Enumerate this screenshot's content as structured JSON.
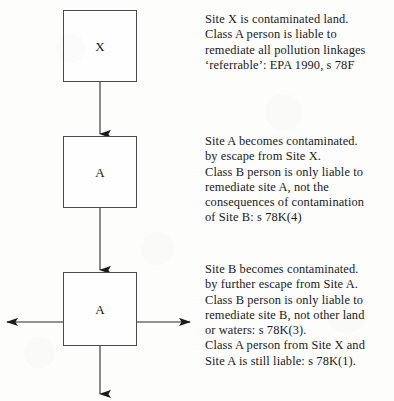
{
  "diagram": {
    "ink_color": "#1a1a1a",
    "background_color": "#fdfdfc",
    "nodes": [
      {
        "id": "site-x",
        "label": "X"
      },
      {
        "id": "site-a",
        "label": "A"
      },
      {
        "id": "site-b",
        "label": "A"
      }
    ],
    "annotations": [
      {
        "id": "annotation-site-x",
        "lines": [
          "Site X is contaminated land.",
          "Class A person is liable to",
          "remediate all pollution linkages",
          "‘referrable’: EPA 1990, s 78F"
        ]
      },
      {
        "id": "annotation-site-a",
        "lines": [
          "Site A becomes contaminated.",
          "by escape from Site X.",
          "Class B person is only liable to",
          "remediate site A, not the",
          "consequences of contamination",
          "of Site B: s 78K(4)"
        ]
      },
      {
        "id": "annotation-site-b",
        "lines": [
          "Site B becomes contaminated.",
          "by further escape from Site A.",
          "Class B person is only liable to",
          "remediate site B, not other land",
          "or waters: s 78K(3).",
          "Class A person from Site X and",
          "Site A is still liable: s 78K(1)."
        ]
      }
    ],
    "connectors": [
      {
        "id": "arrow-x-to-a",
        "direction": "down"
      },
      {
        "id": "arrow-a-to-b",
        "direction": "down"
      },
      {
        "id": "arrow-b-left",
        "direction": "left"
      },
      {
        "id": "arrow-b-right",
        "direction": "right"
      },
      {
        "id": "arrow-b-down",
        "direction": "down"
      }
    ]
  }
}
